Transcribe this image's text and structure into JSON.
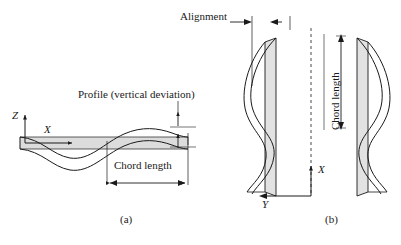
{
  "figure": {
    "annotations": {
      "profile": "Profile (vertical deviation)",
      "alignment": "Alignment",
      "chord_length_a": "Chord length",
      "chord_length_b": "Chord length"
    },
    "axes": {
      "z_label": "Z",
      "x_label_a": "X",
      "x_label_b": "X",
      "y_label": "Y"
    },
    "panels": [
      {
        "id": "a",
        "label": "(a)",
        "view": "side elevation",
        "caption_text": "(a)"
      },
      {
        "id": "b",
        "label": "(b)",
        "view": "plan view",
        "caption_text": "(b)"
      }
    ],
    "colors": {
      "line": "#1a1a1a",
      "fill_band": "#dcdcdc",
      "fill_rail": "#e2e2e2",
      "background": "#ffffff"
    }
  }
}
